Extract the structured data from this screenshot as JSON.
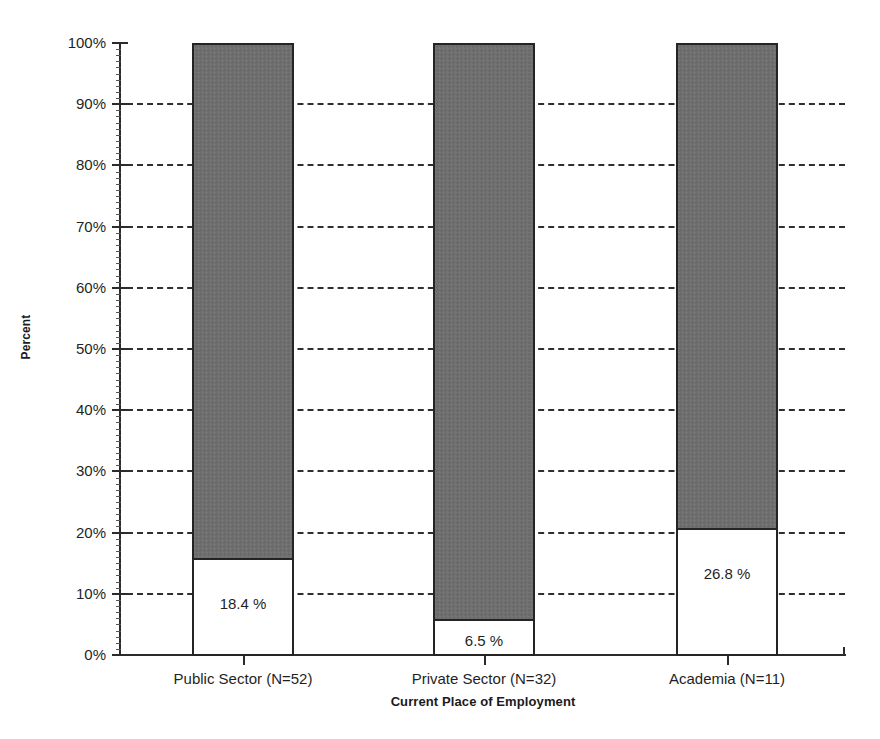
{
  "chart_data": {
    "type": "bar",
    "subtype": "stacked-percentage",
    "title": "",
    "xlabel": "Current Place of Employment",
    "ylabel": "Percent",
    "categories": [
      "Public Sector (N=52)",
      "Private Sector (N=32)",
      "Academia (N=11)"
    ],
    "ylim": [
      0,
      100
    ],
    "y_tick_labels": [
      "0%",
      "10%",
      "20%",
      "30%",
      "40%",
      "50%",
      "60%",
      "70%",
      "80%",
      "90%",
      "100%"
    ],
    "y_tick_values": [
      0,
      10,
      20,
      30,
      40,
      50,
      60,
      70,
      80,
      90,
      100
    ],
    "grid": "horizontal-dashed",
    "legend": "none",
    "series": [
      {
        "name": "Lower segment (white)",
        "color": "#ffffff",
        "values": [
          18.4,
          6.5,
          26.8
        ],
        "plotted_heights_percent": [
          15.9,
          5.9,
          20.8
        ],
        "data_labels": [
          "18.4 %",
          "6.5 %",
          "26.8 %"
        ]
      },
      {
        "name": "Upper segment (gray)",
        "color": "#6e6e6e",
        "values": [
          81.6,
          93.5,
          73.2
        ],
        "plotted_heights_percent": [
          84.1,
          94.1,
          79.2
        ],
        "data_labels": [
          "",
          "",
          ""
        ]
      }
    ]
  },
  "axes": {
    "y_title": "Percent",
    "x_title": "Current Place of Employment",
    "y_ticks": [
      {
        "label": "100%",
        "value": 100
      },
      {
        "label": "90%",
        "value": 90
      },
      {
        "label": "80%",
        "value": 80
      },
      {
        "label": "70%",
        "value": 70
      },
      {
        "label": "60%",
        "value": 60
      },
      {
        "label": "50%",
        "value": 50
      },
      {
        "label": "40%",
        "value": 40
      },
      {
        "label": "30%",
        "value": 30
      },
      {
        "label": "20%",
        "value": 20
      },
      {
        "label": "10%",
        "value": 10
      },
      {
        "label": "0%",
        "value": 0
      }
    ]
  },
  "bars": [
    {
      "category": "Public Sector (N=52)",
      "value_label": "18.4 %",
      "lower_percent": 15.9,
      "upper_percent": 84.1
    },
    {
      "category": "Private Sector (N=32)",
      "value_label": "6.5 %",
      "lower_percent": 5.9,
      "upper_percent": 94.1
    },
    {
      "category": "Academia (N=11)",
      "value_label": "26.8 %",
      "lower_percent": 20.8,
      "upper_percent": 79.2
    }
  ],
  "colors": {
    "gray_fill": "#6e6e6e",
    "white_fill": "#ffffff",
    "outline": "#242424",
    "gridline": "#2f2f2f",
    "axis": "#2b2b2b",
    "background": "#ffffff",
    "text": "#1f1f1f"
  }
}
